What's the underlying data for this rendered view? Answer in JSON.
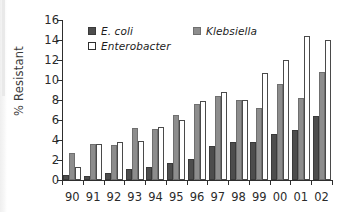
{
  "chart_data": {
    "type": "bar",
    "title": "",
    "subtitle": "",
    "xlabel": "",
    "ylabel": "% Resistant",
    "ylim": [
      0,
      16
    ],
    "yticks": [
      0,
      2,
      4,
      6,
      8,
      10,
      12,
      14,
      16
    ],
    "ytick_labels": [
      "0",
      "2",
      "4",
      "6",
      "8",
      "10",
      "12",
      "14",
      "16"
    ],
    "grid": false,
    "legend_position": "top-left-inside",
    "categories": [
      "90",
      "91",
      "92",
      "93",
      "94",
      "95",
      "96",
      "97",
      "98",
      "99",
      "00",
      "01",
      "02"
    ],
    "series": [
      {
        "name": "E. coli",
        "color": "#4d4d4d",
        "values": [
          0.5,
          0.4,
          0.7,
          1.1,
          1.35,
          1.75,
          2.15,
          3.4,
          3.85,
          3.85,
          4.6,
          5.0,
          6.4
        ]
      },
      {
        "name": "Klebsiella",
        "color": "#8d8d8d",
        "values": [
          2.7,
          3.6,
          3.5,
          5.2,
          5.1,
          6.5,
          7.6,
          8.4,
          8.0,
          7.2,
          9.6,
          8.2,
          10.8
        ]
      },
      {
        "name": "Enterobacter",
        "color": "#ffffff",
        "values": [
          1.3,
          3.6,
          3.8,
          3.9,
          5.3,
          6.0,
          7.95,
          8.8,
          8.0,
          10.7,
          12.0,
          14.4,
          14.0
        ]
      }
    ]
  },
  "legend": {
    "items": [
      {
        "label": "E. coli",
        "swatch": "ec"
      },
      {
        "label": "Klebsiella",
        "swatch": "kleb"
      },
      {
        "label": "Enterobacter",
        "swatch": "entero"
      }
    ]
  }
}
